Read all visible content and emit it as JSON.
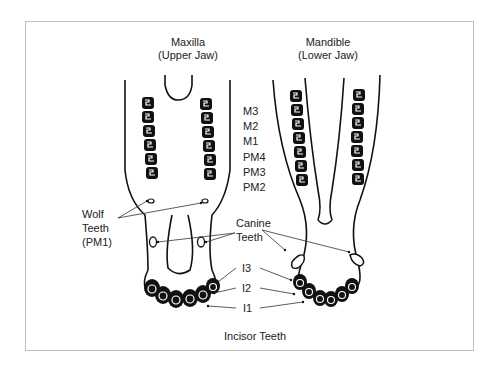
{
  "diagram": {
    "type": "anatomical-diagram",
    "jaws": [
      {
        "name": "Maxilla",
        "subtitle": "(Upper Jaw)"
      },
      {
        "name": "Mandible",
        "subtitle": "(Lower Jaw)"
      }
    ],
    "cheek_teeth": [
      "M3",
      "M2",
      "M1",
      "PM4",
      "PM3",
      "PM2"
    ],
    "wolf_teeth": {
      "line1": "Wolf",
      "line2": "Teeth",
      "line3": "(PM1)"
    },
    "canine_teeth": {
      "line1": "Canine",
      "line2": "Teeth"
    },
    "incisors": [
      "I3",
      "I2",
      "I1"
    ],
    "incisor_caption": "Incisor Teeth"
  },
  "colors": {
    "line": "#111111",
    "border": "#c0c0c0",
    "text": "#222222"
  }
}
